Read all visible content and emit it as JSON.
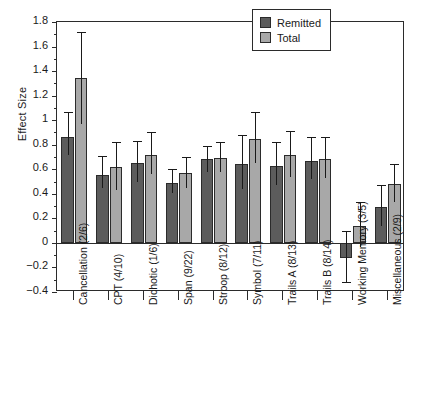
{
  "chart_data": {
    "type": "bar",
    "title": "",
    "xlabel": "",
    "ylabel": "Effect Size",
    "ylim": [
      -0.4,
      1.8
    ],
    "ytick_labels": [
      "1.8",
      "1.6",
      "1.4",
      "1.2",
      "1",
      "0.8",
      "0.6",
      "0.4",
      "0.2",
      "0",
      "−0.2",
      "−0.4"
    ],
    "ytick_values": [
      1.8,
      1.6,
      1.4,
      1.2,
      1.0,
      0.8,
      0.6,
      0.4,
      0.2,
      0.0,
      -0.2,
      -0.4
    ],
    "grid": false,
    "legend_position": "top-right",
    "categories": [
      "Cancellation (2/6)",
      "CPT (4/10)",
      "Dichotic (1/6)",
      "Span (9/22)",
      "Stroop (8/12)",
      "Symbol (7/11)",
      "Trails A (8/13)",
      "Trails B (8/14)",
      "Working Memory (3/5)",
      "Miscellaneous (2/9)"
    ],
    "series": [
      {
        "name": "Remitted",
        "color": "#5c5c5c",
        "values": [
          0.86,
          0.55,
          0.65,
          0.49,
          0.68,
          0.64,
          0.63,
          0.67,
          -0.12,
          0.29
        ],
        "err_low": [
          0.72,
          0.45,
          0.5,
          0.41,
          0.58,
          0.44,
          0.47,
          0.52,
          -0.33,
          0.14
        ],
        "err_high": [
          1.07,
          0.71,
          0.83,
          0.6,
          0.79,
          0.88,
          0.82,
          0.86,
          0.1,
          0.47
        ]
      },
      {
        "name": "Total",
        "color": "#a8a8a8",
        "values": [
          1.34,
          0.62,
          0.72,
          0.57,
          0.69,
          0.85,
          0.72,
          0.68,
          0.14,
          0.48
        ],
        "err_low": [
          0.97,
          0.43,
          0.56,
          0.45,
          0.58,
          0.65,
          0.54,
          0.53,
          -0.03,
          0.33
        ],
        "err_high": [
          1.72,
          0.82,
          0.9,
          0.7,
          0.82,
          1.07,
          0.91,
          0.86,
          0.33,
          0.64
        ]
      }
    ]
  },
  "legend": {
    "entries": [
      {
        "label": "Remitted",
        "color": "#5c5c5c"
      },
      {
        "label": "Total",
        "color": "#a8a8a8"
      }
    ]
  },
  "axis": {
    "y_title": "Effect Size"
  }
}
